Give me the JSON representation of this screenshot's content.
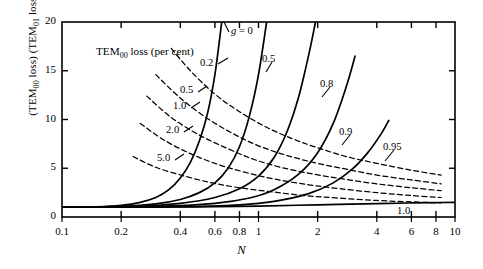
{
  "figure": {
    "in_plot_title": "TEM₀₀ loss (per cent)",
    "y_axis_label_html": "(TEM₀₀ loss) (TEM₀₁ loss)⁻¹",
    "x_axis_label": "N"
  },
  "axes": {
    "y_ticks": [
      "0",
      "5",
      "10",
      "15",
      "20"
    ],
    "x_ticks": [
      "0.1",
      "0.2",
      "0.4",
      "0.6",
      "0.8",
      "1",
      "2",
      "4",
      "6",
      "8",
      "10"
    ]
  },
  "labels": {
    "g_equals_zero": "g = 0",
    "g_series": [
      "0.5",
      "0.8",
      "0.9",
      "0.95",
      "1.0"
    ],
    "loss_contours": [
      "0.2",
      "0.5",
      "1.0",
      "2.0",
      "5.0"
    ]
  },
  "chart_data": {
    "type": "line",
    "xlabel": "N",
    "ylabel": "(TEM₀₀ loss) (TEM₀₁ loss)⁻¹",
    "xscale": "log",
    "yscale": "linear",
    "xlim": [
      0.1,
      10
    ],
    "ylim": [
      0,
      20
    ],
    "grid": false,
    "legend": "inline-curve-labels",
    "x_tick_values": [
      0.1,
      0.2,
      0.4,
      0.6,
      0.8,
      1,
      2,
      4,
      6,
      8,
      10
    ],
    "y_tick_values": [
      0,
      5,
      10,
      15,
      20
    ],
    "series": [
      {
        "name": "g = 0",
        "style": "solid",
        "label": "g = 0",
        "x": [
          0.1,
          0.15,
          0.2,
          0.25,
          0.3,
          0.35,
          0.4,
          0.45,
          0.5,
          0.55,
          0.6,
          0.65
        ],
        "y": [
          1.0,
          1.05,
          1.2,
          1.5,
          2.0,
          2.8,
          4.0,
          5.6,
          7.8,
          10.6,
          14.6,
          20.0
        ]
      },
      {
        "name": "g = 0.5",
        "style": "solid",
        "label": "0.5",
        "x": [
          0.1,
          0.2,
          0.3,
          0.4,
          0.5,
          0.6,
          0.7,
          0.8,
          0.9,
          1.0,
          1.1
        ],
        "y": [
          1.0,
          1.1,
          1.35,
          1.8,
          2.5,
          3.5,
          5.0,
          7.2,
          10.4,
          14.6,
          20.0
        ]
      },
      {
        "name": "g = 0.8",
        "style": "solid",
        "label": "0.8",
        "x": [
          0.1,
          0.25,
          0.4,
          0.6,
          0.8,
          1.0,
          1.2,
          1.4,
          1.6,
          1.8,
          1.95
        ],
        "y": [
          1.0,
          1.1,
          1.4,
          2.0,
          2.9,
          4.2,
          6.1,
          8.8,
          12.3,
          16.6,
          20.0
        ]
      },
      {
        "name": "g = 0.9",
        "style": "solid",
        "label": "0.9",
        "x": [
          0.1,
          0.3,
          0.6,
          0.9,
          1.2,
          1.6,
          2.0,
          2.4,
          2.8,
          3.1
        ],
        "y": [
          1.0,
          1.08,
          1.4,
          1.95,
          2.8,
          4.4,
          6.6,
          9.6,
          13.4,
          16.5
        ]
      },
      {
        "name": "g = 0.95",
        "style": "solid",
        "label": "0.95",
        "x": [
          0.1,
          0.4,
          0.8,
          1.2,
          1.8,
          2.4,
          3.0,
          3.6,
          4.2,
          4.6
        ],
        "y": [
          1.0,
          1.05,
          1.25,
          1.6,
          2.4,
          3.5,
          4.9,
          6.6,
          8.5,
          9.9
        ]
      },
      {
        "name": "g = 1.0",
        "style": "solid",
        "label": "1.0",
        "x": [
          0.1,
          0.3,
          0.6,
          1.0,
          2.0,
          4.0,
          6.0,
          8.0,
          10.0
        ],
        "y": [
          1.0,
          1.02,
          1.06,
          1.12,
          1.25,
          1.38,
          1.44,
          1.48,
          1.5
        ]
      },
      {
        "name": "TEM00 loss 0.2 per cent",
        "style": "dashed",
        "label": "0.2",
        "x": [
          0.36,
          0.45,
          0.6,
          0.8,
          1.1,
          1.5,
          2.0,
          2.8,
          4.0,
          6.0,
          8.5
        ],
        "y": [
          17.3,
          15.0,
          12.6,
          10.8,
          9.2,
          8.0,
          7.1,
          6.2,
          5.5,
          4.8,
          4.3
        ]
      },
      {
        "name": "TEM00 loss 0.5 per cent",
        "style": "dashed",
        "label": "0.5",
        "x": [
          0.3,
          0.4,
          0.55,
          0.75,
          1.0,
          1.4,
          2.0,
          2.8,
          4.0,
          6.0,
          8.5
        ],
        "y": [
          14.6,
          12.2,
          10.1,
          8.5,
          7.3,
          6.3,
          5.5,
          4.9,
          4.3,
          3.8,
          3.4
        ]
      },
      {
        "name": "TEM00 loss 1.0 per cent",
        "style": "dashed",
        "label": "1.0",
        "x": [
          0.27,
          0.36,
          0.5,
          0.7,
          0.95,
          1.3,
          1.9,
          2.7,
          4.0,
          6.0,
          8.5
        ],
        "y": [
          12.4,
          10.2,
          8.4,
          7.0,
          5.9,
          5.1,
          4.4,
          3.9,
          3.4,
          3.0,
          2.7
        ]
      },
      {
        "name": "TEM00 loss 2.0 per cent",
        "style": "dashed",
        "label": "2.0",
        "x": [
          0.25,
          0.33,
          0.45,
          0.62,
          0.85,
          1.2,
          1.8,
          2.6,
          4.0,
          6.0,
          8.5
        ],
        "y": [
          9.6,
          7.9,
          6.5,
          5.4,
          4.6,
          3.9,
          3.3,
          2.9,
          2.5,
          2.2,
          2.0
        ]
      },
      {
        "name": "TEM00 loss 5.0 per cent",
        "style": "dashed",
        "label": "5.0",
        "x": [
          0.23,
          0.3,
          0.42,
          0.58,
          0.8,
          1.15,
          1.7,
          2.5,
          4.0,
          6.0,
          8.5
        ],
        "y": [
          6.2,
          5.1,
          4.2,
          3.5,
          3.0,
          2.6,
          2.2,
          1.95,
          1.7,
          1.55,
          1.45
        ]
      }
    ]
  }
}
